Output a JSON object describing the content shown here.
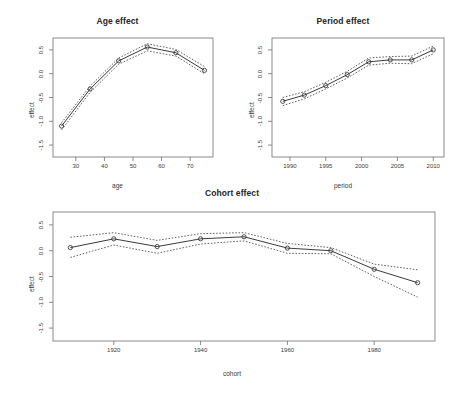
{
  "figure": {
    "background": "#ffffff",
    "line_color": "#3b3b3b",
    "axis_color": "#6e6e6e"
  },
  "panels": {
    "age": {
      "title": "Age effect",
      "xlabel": "age",
      "ylabel": "effect"
    },
    "period": {
      "title": "Period effect",
      "xlabel": "period",
      "ylabel": "effect"
    },
    "cohort": {
      "title": "Cohort effect",
      "xlabel": "cohort",
      "ylabel": "effect"
    }
  },
  "chart_data": [
    {
      "type": "line",
      "id": "age-effect",
      "title": "Age effect",
      "xlabel": "age",
      "ylabel": "effect",
      "xlim": [
        22,
        78
      ],
      "ylim": [
        -1.75,
        0.75
      ],
      "xticks": [
        30,
        40,
        50,
        60,
        70
      ],
      "yticks": [
        0.5,
        0.0,
        -0.5,
        -1.0,
        -1.5
      ],
      "ytick_labels": [
        "0.5",
        "0.0",
        "-0.5",
        "-1.0",
        "-1.5"
      ],
      "grid": false,
      "legend": null,
      "x": [
        25,
        35,
        45,
        55,
        65,
        75
      ],
      "series": [
        {
          "name": "estimate",
          "style": "solid-with-points",
          "values": [
            -1.1,
            -0.32,
            0.27,
            0.56,
            0.44,
            0.07
          ]
        },
        {
          "name": "upper CI",
          "style": "dashed",
          "values": [
            -1.03,
            -0.26,
            0.33,
            0.63,
            0.51,
            0.15
          ]
        },
        {
          "name": "lower CI",
          "style": "dashed",
          "values": [
            -1.18,
            -0.39,
            0.2,
            0.48,
            0.37,
            0.0
          ]
        }
      ]
    },
    {
      "type": "line",
      "id": "period-effect",
      "title": "Period effect",
      "xlabel": "period",
      "ylabel": "effect",
      "xlim": [
        1987.5,
        2011.5
      ],
      "ylim": [
        -1.75,
        0.75
      ],
      "xticks": [
        1990,
        1995,
        2000,
        2005,
        2010
      ],
      "yticks": [
        0.5,
        0.0,
        -0.5,
        -1.0,
        -1.5
      ],
      "ytick_labels": [
        "0.5",
        "0.0",
        "-0.5",
        "-1.0",
        "-1.5"
      ],
      "grid": false,
      "legend": null,
      "x": [
        1989,
        1992,
        1995,
        1998,
        2001,
        2004,
        2007,
        2010
      ],
      "series": [
        {
          "name": "estimate",
          "style": "solid-with-points",
          "values": [
            -0.58,
            -0.45,
            -0.25,
            -0.02,
            0.25,
            0.29,
            0.29,
            0.5
          ]
        },
        {
          "name": "upper CI",
          "style": "dashed",
          "values": [
            -0.5,
            -0.38,
            -0.18,
            0.05,
            0.33,
            0.36,
            0.37,
            0.58
          ]
        },
        {
          "name": "lower CI",
          "style": "dashed",
          "values": [
            -0.67,
            -0.53,
            -0.32,
            -0.09,
            0.18,
            0.22,
            0.21,
            0.42
          ]
        }
      ]
    },
    {
      "type": "line",
      "id": "cohort-effect",
      "title": "Cohort effect",
      "xlabel": "cohort",
      "ylabel": "effect",
      "xlim": [
        1906,
        1994
      ],
      "ylim": [
        -1.75,
        0.75
      ],
      "xticks": [
        1920,
        1940,
        1960,
        1980
      ],
      "yticks": [
        0.5,
        0.0,
        -0.5,
        -1.0,
        -1.5
      ],
      "ytick_labels": [
        "0.5",
        "0.0",
        "-0.5",
        "-1.0",
        "-1.5"
      ],
      "grid": false,
      "legend": null,
      "x": [
        1910,
        1920,
        1930,
        1940,
        1950,
        1960,
        1970,
        1980,
        1990
      ],
      "series": [
        {
          "name": "estimate",
          "style": "solid-with-points",
          "values": [
            0.06,
            0.23,
            0.08,
            0.23,
            0.27,
            0.05,
            0.0,
            -0.36,
            -0.62
          ]
        },
        {
          "name": "upper CI",
          "style": "dashed",
          "values": [
            0.26,
            0.35,
            0.2,
            0.33,
            0.35,
            0.14,
            0.06,
            -0.26,
            -0.37
          ]
        },
        {
          "name": "lower CI",
          "style": "dashed",
          "values": [
            -0.13,
            0.11,
            -0.05,
            0.13,
            0.19,
            -0.05,
            -0.06,
            -0.5,
            -0.9
          ]
        }
      ]
    }
  ]
}
